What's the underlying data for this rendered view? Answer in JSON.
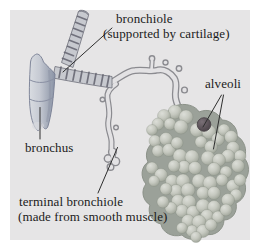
{
  "figure": {
    "type": "anatomy-diagram",
    "background_color": "#ffffff",
    "panel_color": "#e6e5e6",
    "text_color": "#1b1b1b",
    "pointer_line_color": "#2e2e2e"
  },
  "labels": {
    "bronchiole": {
      "line1": "bronchiole",
      "line2": "(supported by cartilage)"
    },
    "alveoli": "alveoli",
    "bronchus": "bronchus",
    "terminal_bronchiole": {
      "line1": "terminal bronchiole",
      "line2": "(made from smooth muscle)"
    }
  },
  "illustration_colors": {
    "bronchus_tube": "#a9b0bf",
    "cartilage_band": "#63636f",
    "banded_tube_fill": "#c7c9cf",
    "smooth_tube_fill": "#e3e2e4",
    "smooth_tube_outline": "#8b8b90",
    "alveoli_bubble": "#c6c9c0",
    "alveoli_shadow": "#9ba199",
    "dark_alveolus": "#584f55"
  }
}
